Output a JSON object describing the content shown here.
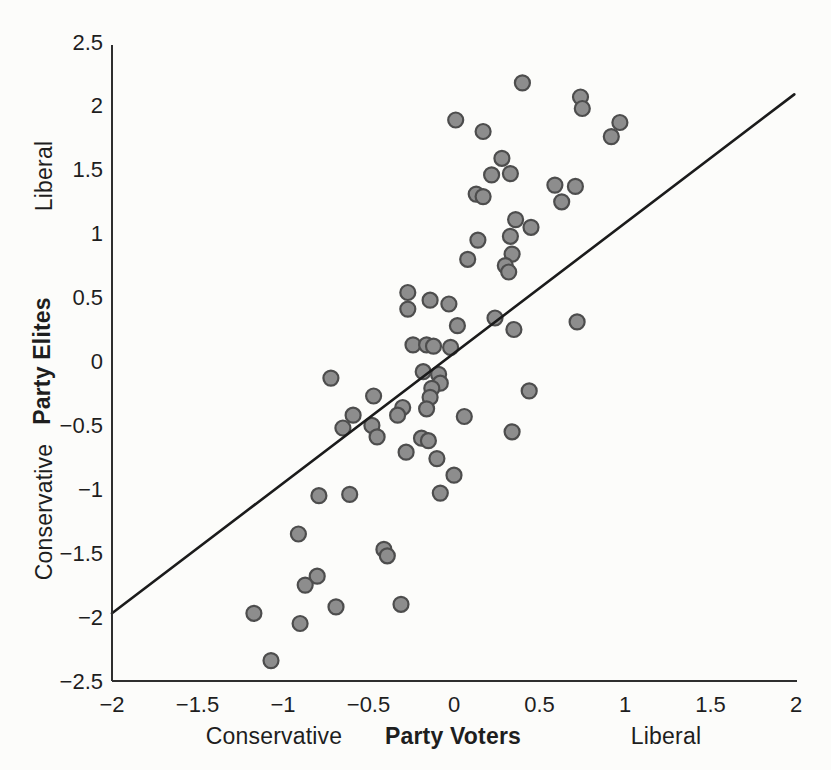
{
  "figure": {
    "background_color": "#fcfcfa",
    "axis_color": "#2e2e2e",
    "text_color": "#1e1e1e"
  },
  "chart_data": {
    "type": "scatter",
    "title": "",
    "xlabel": "Party Voters",
    "ylabel": "Party Elites",
    "x_axis_end_labels": {
      "left": "Conservative",
      "right": "Liberal"
    },
    "y_axis_end_labels": {
      "bottom": "Conservative",
      "top": "Liberal"
    },
    "xlim": [
      -2,
      2
    ],
    "ylim": [
      -2.5,
      2.5
    ],
    "x_ticks": [
      -2,
      -1.5,
      -1,
      -0.5,
      0,
      0.5,
      1,
      1.5,
      2
    ],
    "y_ticks": [
      2.5,
      2,
      1.5,
      1,
      0.5,
      0,
      -0.5,
      -1,
      -1.5,
      -2,
      -2.5
    ],
    "grid": false,
    "legend_position": "none",
    "marker": {
      "shape": "circle",
      "fill": "#8d8d8d",
      "stroke": "#4d4d4d",
      "radius": 7.5,
      "stroke_width": 2.2
    },
    "trend_line": {
      "from": [
        -2,
        -1.97
      ],
      "to": [
        1.99,
        2.09
      ],
      "color": "#1b1b1b",
      "width": 2.6
    },
    "points": [
      [
        0.4,
        2.18
      ],
      [
        0.74,
        2.07
      ],
      [
        0.75,
        1.98
      ],
      [
        0.97,
        1.87
      ],
      [
        0.92,
        1.76
      ],
      [
        0.01,
        1.89
      ],
      [
        0.17,
        1.8
      ],
      [
        0.28,
        1.59
      ],
      [
        0.22,
        1.46
      ],
      [
        0.33,
        1.47
      ],
      [
        0.13,
        1.31
      ],
      [
        0.17,
        1.29
      ],
      [
        0.59,
        1.38
      ],
      [
        0.71,
        1.37
      ],
      [
        0.63,
        1.25
      ],
      [
        0.36,
        1.11
      ],
      [
        0.45,
        1.05
      ],
      [
        0.33,
        0.98
      ],
      [
        0.14,
        0.95
      ],
      [
        0.08,
        0.8
      ],
      [
        0.34,
        0.84
      ],
      [
        0.3,
        0.75
      ],
      [
        0.32,
        0.7
      ],
      [
        -0.27,
        0.54
      ],
      [
        -0.14,
        0.48
      ],
      [
        -0.03,
        0.45
      ],
      [
        -0.27,
        0.41
      ],
      [
        0.02,
        0.28
      ],
      [
        0.24,
        0.34
      ],
      [
        0.35,
        0.25
      ],
      [
        0.72,
        0.31
      ],
      [
        -0.24,
        0.13
      ],
      [
        -0.16,
        0.13
      ],
      [
        -0.12,
        0.12
      ],
      [
        -0.02,
        0.11
      ],
      [
        -0.72,
        -0.13
      ],
      [
        -0.18,
        -0.08
      ],
      [
        -0.09,
        -0.1
      ],
      [
        -0.08,
        -0.17
      ],
      [
        -0.13,
        -0.21
      ],
      [
        -0.14,
        -0.28
      ],
      [
        -0.47,
        -0.27
      ],
      [
        -0.3,
        -0.36
      ],
      [
        -0.33,
        -0.42
      ],
      [
        -0.16,
        -0.37
      ],
      [
        0.06,
        -0.43
      ],
      [
        -0.59,
        -0.42
      ],
      [
        -0.65,
        -0.52
      ],
      [
        -0.48,
        -0.5
      ],
      [
        -0.45,
        -0.59
      ],
      [
        -0.19,
        -0.6
      ],
      [
        -0.15,
        -0.62
      ],
      [
        0.44,
        -0.23
      ],
      [
        0.34,
        -0.55
      ],
      [
        -0.28,
        -0.71
      ],
      [
        -0.1,
        -0.76
      ],
      [
        0.0,
        -0.89
      ],
      [
        -0.08,
        -1.03
      ],
      [
        -0.79,
        -1.05
      ],
      [
        -0.61,
        -1.04
      ],
      [
        -0.91,
        -1.35
      ],
      [
        -0.41,
        -1.47
      ],
      [
        -0.39,
        -1.52
      ],
      [
        -0.8,
        -1.68
      ],
      [
        -0.87,
        -1.75
      ],
      [
        -0.69,
        -1.92
      ],
      [
        -0.31,
        -1.9
      ],
      [
        -1.17,
        -1.97
      ],
      [
        -0.9,
        -2.05
      ],
      [
        -1.07,
        -2.34
      ]
    ]
  }
}
